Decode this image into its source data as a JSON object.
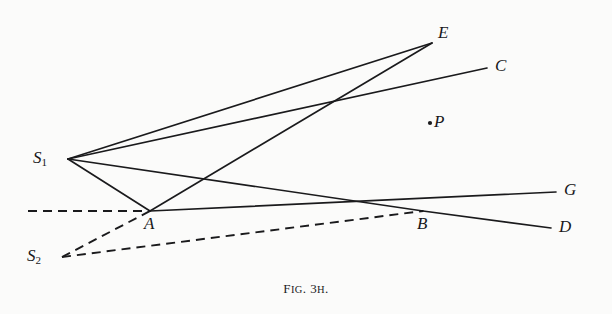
{
  "figure": {
    "caption_prefix": "F",
    "caption_prefix_rest": "IG",
    "caption_mid": ". 3",
    "caption_sub": "H",
    "caption_end": ".",
    "caption_full": "FIG. 3H.",
    "background_color": "#fbfbfa",
    "ink_color": "#1a1a1c"
  },
  "points": {
    "s1": {
      "label": "S",
      "sub": "1",
      "x": 68,
      "y": 159,
      "label_x": 33,
      "label_y": 149
    },
    "s2": {
      "label": "S",
      "sub": "2",
      "x": 62,
      "y": 257,
      "label_x": 27,
      "label_y": 247
    },
    "a": {
      "label": "A",
      "x": 150,
      "y": 211,
      "label_x": 144,
      "label_y": 215
    },
    "b": {
      "label": "B",
      "x": 423,
      "y": 211,
      "label_x": 417,
      "label_y": 215
    },
    "p": {
      "label": "P",
      "x": 430,
      "y": 123,
      "label_x": 434,
      "label_y": 113,
      "dot": true
    },
    "c": {
      "label": "C",
      "x": 487,
      "y": 68,
      "label_x": 495,
      "label_y": 57
    },
    "d": {
      "label": "D",
      "x": 551,
      "y": 228,
      "label_x": 559,
      "label_y": 218
    },
    "e": {
      "label": "E",
      "x": 432,
      "y": 43,
      "label_x": 438,
      "label_y": 24
    },
    "g": {
      "label": "G",
      "x": 556,
      "y": 192,
      "label_x": 564,
      "label_y": 181
    }
  },
  "chart_data": {
    "type": "diagram",
    "title": "FIG. 3H.",
    "solid_segments": [
      {
        "name": "s1-to-e",
        "from": "s1",
        "to": "e",
        "x1": 68,
        "y1": 159,
        "x2": 432,
        "y2": 43
      },
      {
        "name": "s1-to-c",
        "from": "s1",
        "to": "c",
        "x1": 68,
        "y1": 159,
        "x2": 487,
        "y2": 68
      },
      {
        "name": "s1-to-a",
        "from": "s1",
        "to": "a",
        "x1": 68,
        "y1": 159,
        "x2": 150,
        "y2": 211
      },
      {
        "name": "s1-to-b",
        "from": "s1",
        "to": "b",
        "x1": 68,
        "y1": 159,
        "x2": 423,
        "y2": 211
      },
      {
        "name": "a-to-e",
        "from": "a",
        "to": "e",
        "x1": 150,
        "y1": 211,
        "x2": 432,
        "y2": 43
      },
      {
        "name": "a-to-g",
        "from": "a",
        "to": "g",
        "x1": 150,
        "y1": 211,
        "x2": 556,
        "y2": 192
      },
      {
        "name": "b-to-d",
        "from": "b",
        "to": "d",
        "x1": 423,
        "y1": 211,
        "x2": 551,
        "y2": 228
      }
    ],
    "dashed_segments": [
      {
        "name": "axis-dashed",
        "x1": 28,
        "y1": 211,
        "x2": 150,
        "y2": 211
      },
      {
        "name": "s2-to-a",
        "from": "s2",
        "to": "a",
        "x1": 62,
        "y1": 257,
        "x2": 150,
        "y2": 211
      },
      {
        "name": "s2-to-b",
        "from": "s2",
        "to": "b",
        "x1": 62,
        "y1": 257,
        "x2": 423,
        "y2": 211
      }
    ],
    "intersections": [
      {
        "name": "upper-crossing",
        "x": 343,
        "y": 98
      },
      {
        "name": "lower-crossing",
        "x": 205,
        "y": 178
      }
    ]
  }
}
